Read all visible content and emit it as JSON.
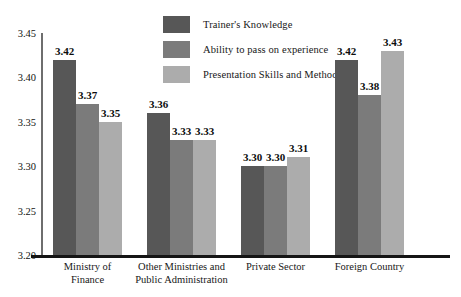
{
  "chart_data": {
    "type": "bar",
    "title": "",
    "subtitle": "",
    "xlabel": "",
    "ylabel": "",
    "ylim": [
      3.2,
      3.45
    ],
    "yticks": [
      "3.20",
      "3.25",
      "3.30",
      "3.35",
      "3.40",
      "3.45"
    ],
    "ytick_values": [
      3.2,
      3.25,
      3.3,
      3.35,
      3.4,
      3.45
    ],
    "grid": false,
    "legend_position": "top-center",
    "categories": [
      "Ministry of Finance",
      "Other Ministries and Public Administration",
      "Private Sector",
      "Foreign Country"
    ],
    "category_lines": [
      [
        "Ministry of",
        "Finance"
      ],
      [
        "Other Ministries and",
        "Public Administration"
      ],
      [
        "Private Sector"
      ],
      [
        "Foreign Country"
      ]
    ],
    "series": [
      {
        "name": "Trainer's Knowledge",
        "color": "#575757",
        "values": [
          3.42,
          3.36,
          3.3,
          3.42
        ],
        "labels": [
          "3.42",
          "3.36",
          "3.30",
          "3.42"
        ]
      },
      {
        "name": "Ability to pass on experience",
        "color": "#7b7b7b",
        "values": [
          3.37,
          3.33,
          3.3,
          3.38
        ],
        "labels": [
          "3.37",
          "3.33",
          "3.30",
          "3.38"
        ]
      },
      {
        "name": "Presentation Skills and Method",
        "color": "#acacac",
        "values": [
          3.35,
          3.33,
          3.31,
          3.43
        ],
        "labels": [
          "3.35",
          "3.33",
          "3.31",
          "3.43"
        ]
      }
    ]
  }
}
